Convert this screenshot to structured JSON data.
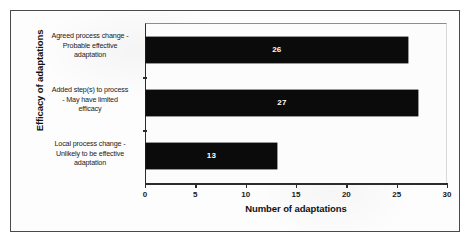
{
  "chart_data": {
    "type": "bar",
    "orientation": "horizontal",
    "title": "",
    "xlabel": "Number of adaptations",
    "ylabel": "Efficacy of adaptations",
    "categories": [
      "Agreed process change - Probable effective adaptation",
      "Added step(s) to process - May have limited efficacy",
      "Local process change - Unlikely to be effective adaptation"
    ],
    "category_lines": [
      [
        "Agreed process change -",
        "Probable effective",
        "adaptation"
      ],
      [
        "Added step(s) to process",
        "- May have limited",
        "efficacy"
      ],
      [
        "Local process change -",
        "Unlikely to be effective",
        "adaptation"
      ]
    ],
    "values": [
      26,
      27,
      13
    ],
    "value_labels": [
      "26",
      "27",
      "13"
    ],
    "xlim": [
      0,
      30
    ],
    "xticks": [
      0,
      5,
      10,
      15,
      20,
      25,
      30
    ],
    "xtick_labels": [
      "0",
      "5",
      "10",
      "15",
      "20",
      "25",
      "30"
    ],
    "grid": false,
    "legend": false,
    "bar_color": "#0b0b0b",
    "value_label_color": "#ffffff",
    "axis_color": "#2c2c2c",
    "plot_background": "#fcfcfc",
    "frame_color": "#4a4a4a"
  }
}
